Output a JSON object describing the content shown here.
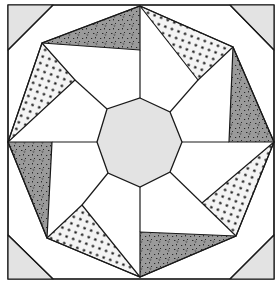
{
  "figure": {
    "caption": "",
    "colors": {
      "background": "#ffffff",
      "outline": "#1a1a1a",
      "light_gray": "#e3e3e3",
      "dark_gray": "#9a9a9a",
      "dot_fill": "#f4f4f4",
      "dot": "#1a1a1a"
    },
    "frame": {
      "x": 8,
      "y": 5,
      "width": 266,
      "height": 274
    },
    "corner_triangles": [
      {
        "name": "top-left",
        "points": "8,5 53,5 8,50"
      },
      {
        "name": "top-right",
        "points": "274,5 230,5 274,50"
      },
      {
        "name": "bottom-left",
        "points": "8,279 8,235 53,279"
      },
      {
        "name": "bottom-right",
        "points": "274,279 230,279 274,235"
      }
    ],
    "outer_octagon": "53,5 230,5 274,50 274,235 230,279 53,279 8,235 8,50",
    "center_octagon": "140,98 170,112 182,142 170,172 140,187 108,173 97,142 107,109",
    "dark_triangles": [
      {
        "name": "top",
        "points": "42,43 140,6 140,50"
      },
      {
        "name": "right",
        "points": "233,47 274,142 229,142"
      },
      {
        "name": "bottom",
        "points": "236,236 140,277 140,232"
      },
      {
        "name": "left",
        "points": "47,238 8,142 52,142"
      }
    ],
    "dotted_triangles": [
      {
        "name": "top-right",
        "points": "140,6 233,47 198,80"
      },
      {
        "name": "bottom-right",
        "points": "274,142 236,236 202,203"
      },
      {
        "name": "bottom-left",
        "points": "140,277 47,238 82,205"
      },
      {
        "name": "top-left",
        "points": "8,142 42,43 75,80"
      }
    ],
    "star_outline": "140,6 233,47 274,142 236,236 140,277 47,238 8,142 42,43",
    "spokes": [
      {
        "name": "top",
        "x1": 140,
        "y1": 98,
        "x2": 140,
        "y2": 50
      },
      {
        "name": "top-right",
        "x1": 170,
        "y1": 112,
        "x2": 198,
        "y2": 80
      },
      {
        "name": "right",
        "x1": 182,
        "y1": 142,
        "x2": 229,
        "y2": 142
      },
      {
        "name": "bottom-right",
        "x1": 170,
        "y1": 172,
        "x2": 202,
        "y2": 203
      },
      {
        "name": "bottom",
        "x1": 140,
        "y1": 187,
        "x2": 140,
        "y2": 232
      },
      {
        "name": "bottom-left",
        "x1": 108,
        "y1": 173,
        "x2": 82,
        "y2": 205
      },
      {
        "name": "left",
        "x1": 97,
        "y1": 142,
        "x2": 52,
        "y2": 142
      },
      {
        "name": "top-left",
        "x1": 107,
        "y1": 109,
        "x2": 75,
        "y2": 80
      }
    ]
  }
}
